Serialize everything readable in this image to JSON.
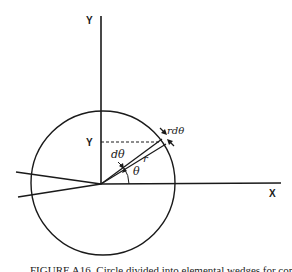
{
  "figure": {
    "labels": {
      "y_axis": "Y",
      "x_axis": "X",
      "y_value": "Y",
      "d_theta": "dθ",
      "r": "r",
      "theta": "θ",
      "r_d_theta": "rdθ"
    },
    "caption": "FIGURE A16. Circle divided into elemental wedges for computing moments"
  },
  "colors": {
    "line": "#1a1a1a",
    "background": "#ffffff"
  }
}
